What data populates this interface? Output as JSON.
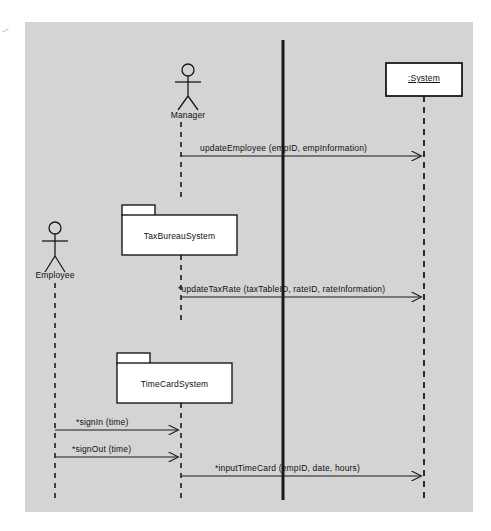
{
  "diagram": {
    "type": "uml-sequence-diagram",
    "background_color": "#d4d4d4",
    "page_color": "#ffffff",
    "line_color": "#1a1a1a",
    "box_fill": "#ffffff"
  },
  "participants": [
    {
      "id": "employee",
      "kind": "actor",
      "label": "Employee",
      "x": 55,
      "head_y": 228,
      "lifeline_top": 283,
      "lifeline_bottom": 500
    },
    {
      "id": "manager",
      "kind": "actor",
      "label": "Manager",
      "x": 188,
      "head_y": 70,
      "lifeline_top": 120,
      "lifeline_bottom": 198
    },
    {
      "id": "taxbureausystem",
      "kind": "package",
      "label": "TaxBureauSystem",
      "x": 181,
      "box_left": 122,
      "box_top": 215,
      "box_width": 115,
      "box_height": 40,
      "tab_width": 33,
      "tab_height": 10,
      "lifeline_top": 255,
      "lifeline_bottom": 320
    },
    {
      "id": "timecardsystem",
      "kind": "package",
      "label": "TimeCardSystem",
      "x": 181,
      "box_left": 117,
      "box_top": 363,
      "box_width": 115,
      "box_height": 40,
      "tab_width": 33,
      "tab_height": 10,
      "lifeline_top": 403,
      "lifeline_bottom": 500
    },
    {
      "id": "system",
      "kind": "object",
      "label": ":System",
      "x": 424,
      "box_left": 386,
      "box_top": 63,
      "box_width": 76,
      "box_height": 33,
      "lifeline_top": 96,
      "lifeline_bottom": 500
    }
  ],
  "activation_bar": {
    "name": "system-activation-bar",
    "x": 283,
    "top": 40,
    "bottom": 500,
    "width": 3
  },
  "messages": [
    {
      "id": "msg-update-employee",
      "label": "updateEmployee (empID, empInformation)",
      "from": "manager",
      "to": "system",
      "from_x": 181,
      "to_x": 424,
      "y": 156,
      "label_x": 200,
      "label_y": 143,
      "iterative": false
    },
    {
      "id": "msg-update-tax-rate",
      "label": "*updateTaxRate (taxTableID, rateID, rateInformation)",
      "from": "taxbureausystem",
      "to": "system",
      "from_x": 181,
      "to_x": 424,
      "y": 297,
      "label_x": 178,
      "label_y": 284,
      "iterative": true
    },
    {
      "id": "msg-sign-in",
      "label": "*signIn (time)",
      "from": "employee",
      "to": "timecardsystem",
      "from_x": 55,
      "to_x": 181,
      "y": 430,
      "label_x": 76,
      "label_y": 417,
      "iterative": true
    },
    {
      "id": "msg-sign-out",
      "label": "*signOut (time)",
      "from": "employee",
      "to": "timecardsystem",
      "from_x": 55,
      "to_x": 181,
      "y": 457,
      "label_x": 72,
      "label_y": 444,
      "iterative": true
    },
    {
      "id": "msg-input-time-card",
      "label": "*inputTimeCard (empID, date, hours)",
      "from": "timecardsystem",
      "to": "system",
      "from_x": 181,
      "to_x": 424,
      "y": 476,
      "label_x": 215,
      "label_y": 463,
      "iterative": true
    }
  ]
}
